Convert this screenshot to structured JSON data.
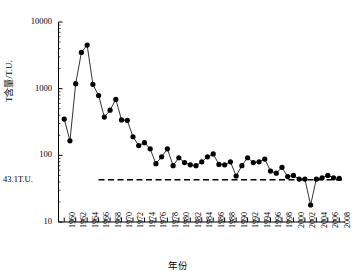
{
  "chart_data": {
    "type": "line",
    "title": "",
    "subtitle": "",
    "xlabel": "年份",
    "ylabel": "T含量/T.U.",
    "yscale": "log",
    "ylim": [
      10,
      10000
    ],
    "xlim": [
      1959,
      2009
    ],
    "grid": false,
    "legend": null,
    "ytick_labels": [
      "10000",
      "1000",
      "100",
      "10"
    ],
    "ytick_values": [
      10000,
      1000,
      100,
      10
    ],
    "xtick_labels": [
      "1960",
      "1962",
      "1964",
      "1966",
      "1968",
      "1970",
      "1972",
      "1974",
      "1976",
      "1978",
      "1980",
      "1982",
      "1984",
      "1986",
      "1988",
      "1990",
      "1992",
      "1994",
      "1996",
      "1998",
      "2000",
      "2002",
      "2004",
      "2006",
      "2008"
    ],
    "xtick_values": [
      1960,
      1962,
      1964,
      1966,
      1968,
      1970,
      1972,
      1974,
      1976,
      1978,
      1980,
      1982,
      1984,
      1986,
      1988,
      1990,
      1992,
      1994,
      1996,
      1998,
      2000,
      2002,
      2004,
      2006,
      2008
    ],
    "annotations": [
      {
        "name": "threshold-line",
        "label": "43.1T.U.",
        "value": 43.1,
        "style": "dashed-horizontal"
      }
    ],
    "series": [
      {
        "name": "T含量",
        "marker": "filled-circle",
        "line": "solid",
        "color": "#000000",
        "x": [
          1960,
          1961,
          1962,
          1963,
          1964,
          1965,
          1966,
          1967,
          1968,
          1969,
          1970,
          1971,
          1972,
          1973,
          1974,
          1975,
          1976,
          1977,
          1978,
          1979,
          1980,
          1981,
          1982,
          1983,
          1984,
          1985,
          1986,
          1987,
          1988,
          1989,
          1990,
          1991,
          1992,
          1993,
          1994,
          1995,
          1996,
          1997,
          1998,
          1999,
          2000,
          2001,
          2002,
          2003,
          2004,
          2005,
          2006,
          2007,
          2008
        ],
        "values": [
          350,
          165,
          1190,
          3500,
          4500,
          1160,
          790,
          375,
          475,
          690,
          340,
          335,
          190,
          140,
          155,
          125,
          75,
          95,
          125,
          70,
          92,
          78,
          72,
          70,
          80,
          95,
          105,
          73,
          72,
          80,
          49,
          70,
          92,
          78,
          80,
          88,
          58,
          54,
          66,
          48,
          50,
          44,
          44,
          18,
          44,
          46,
          50,
          46,
          45
        ]
      }
    ]
  }
}
